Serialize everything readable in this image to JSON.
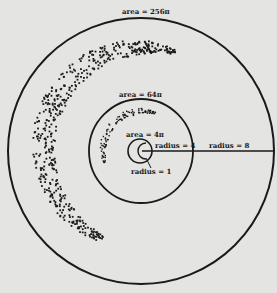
{
  "diagram": {
    "background": "#e4e4e2",
    "ink": "#1a1a1a",
    "center": {
      "x": 142,
      "y": 151
    },
    "circles": [
      {
        "name": "outer",
        "radius_px": 133,
        "label": "area = 256π",
        "radius_label": "radius = 8"
      },
      {
        "name": "middle",
        "radius_px": 53,
        "label": "area = 64π",
        "radius_label": "radius = 4"
      },
      {
        "name": "inner",
        "radius_px": 13,
        "label": "area = 4π",
        "radius_label": "radius = 1"
      }
    ]
  },
  "labels": {
    "outer_area": "area = 256π",
    "middle_area": "area = 64π",
    "inner_area": "area = 4π",
    "radius_outer": "radius = 8",
    "radius_middle": "radius = 4",
    "radius_inner": "radius = 1"
  }
}
